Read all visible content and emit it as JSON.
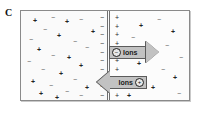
{
  "figure": {
    "panel_letter": "C",
    "type": "membrane-ion-diffusion-diagram"
  },
  "membrane": {
    "negative_side_charges": [
      "−",
      "−",
      "−",
      "−",
      "−",
      "−",
      "−",
      "−",
      "−",
      "−"
    ],
    "positive_side_charges": [
      "+",
      "+",
      "+",
      "+",
      "+",
      "+",
      "+",
      "+",
      "+",
      "+"
    ]
  },
  "arrows": {
    "right": {
      "direction": "right",
      "label": "Ions",
      "ion_symbol": "⊙",
      "ion_charge": "−"
    },
    "left": {
      "direction": "left",
      "label": "Ions",
      "ion_symbol": "⊙",
      "ion_charge": "+"
    }
  },
  "compartments": {
    "left": {
      "name": "left-compartment",
      "ions": [
        {
          "sign": "+",
          "x": 12,
          "y": 9
        },
        {
          "sign": "−",
          "x": 30,
          "y": 6
        },
        {
          "sign": "−",
          "x": 22,
          "y": 18
        },
        {
          "sign": "+",
          "x": 44,
          "y": 10
        },
        {
          "sign": "−",
          "x": 58,
          "y": 8
        },
        {
          "sign": "+",
          "x": 70,
          "y": 20
        },
        {
          "sign": "−",
          "x": 8,
          "y": 28
        },
        {
          "sign": "+",
          "x": 36,
          "y": 24
        },
        {
          "sign": "−",
          "x": 52,
          "y": 30
        },
        {
          "sign": "+",
          "x": 16,
          "y": 38
        },
        {
          "sign": "−",
          "x": 64,
          "y": 36
        },
        {
          "sign": "−",
          "x": 30,
          "y": 44
        },
        {
          "sign": "+",
          "x": 46,
          "y": 46
        },
        {
          "sign": "−",
          "x": 6,
          "y": 50
        },
        {
          "sign": "+",
          "x": 58,
          "y": 54
        },
        {
          "sign": "−",
          "x": 20,
          "y": 58
        },
        {
          "sign": "+",
          "x": 38,
          "y": 62
        },
        {
          "sign": "−",
          "x": 52,
          "y": 68
        },
        {
          "sign": "+",
          "x": 10,
          "y": 70
        },
        {
          "sign": "−",
          "x": 28,
          "y": 74
        },
        {
          "sign": "+",
          "x": 64,
          "y": 76
        },
        {
          "sign": "−",
          "x": 44,
          "y": 80
        },
        {
          "sign": "+",
          "x": 18,
          "y": 82
        },
        {
          "sign": "−",
          "x": 58,
          "y": 84
        },
        {
          "sign": "+",
          "x": 34,
          "y": 86
        }
      ]
    },
    "right": {
      "name": "right-compartment",
      "ions": [
        {
          "sign": "+",
          "x": 22,
          "y": 14
        },
        {
          "sign": "−",
          "x": 40,
          "y": 8
        },
        {
          "sign": "+",
          "x": 54,
          "y": 20
        },
        {
          "sign": "−",
          "x": 14,
          "y": 26
        },
        {
          "sign": "−",
          "x": 48,
          "y": 34
        },
        {
          "sign": "+",
          "x": 30,
          "y": 40
        },
        {
          "sign": "−",
          "x": 62,
          "y": 46
        },
        {
          "sign": "+",
          "x": 20,
          "y": 52
        },
        {
          "sign": "−",
          "x": 44,
          "y": 58
        },
        {
          "sign": "+",
          "x": 56,
          "y": 66
        },
        {
          "sign": "−",
          "x": 16,
          "y": 70
        },
        {
          "sign": "+",
          "x": 34,
          "y": 76
        },
        {
          "sign": "−",
          "x": 60,
          "y": 82
        },
        {
          "sign": "+",
          "x": 10,
          "y": 84
        }
      ]
    }
  },
  "colors": {
    "arrow_fill": "#c2c2c2",
    "arrow_stroke": "#5b5b5b",
    "chamber_border": "#8a8a8a",
    "chamber_fill": "#fbfbfb",
    "membrane_line": "#6f6f6f",
    "text": "#111111"
  }
}
